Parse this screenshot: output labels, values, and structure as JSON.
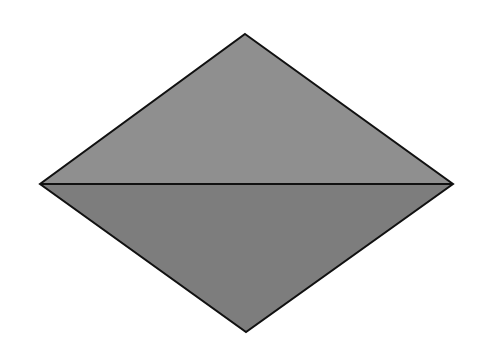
{
  "diagram": {
    "type": "rhombus-split-by-diagonal",
    "background": "#ffffff",
    "stroke_color": "#111111",
    "stroke_width": 2,
    "vertices": {
      "top": [
        245,
        34
      ],
      "left": [
        40,
        184
      ],
      "right": [
        453,
        184
      ],
      "bottom": [
        246,
        332
      ]
    },
    "regions": [
      {
        "name": "upper-triangle",
        "fill": "#8f8f8f",
        "points": [
          "top",
          "right",
          "left"
        ]
      },
      {
        "name": "lower-triangle",
        "fill": "#7d7d7d",
        "points": [
          "left",
          "right",
          "bottom"
        ]
      }
    ],
    "diagonal": {
      "from": "left",
      "to": "right"
    }
  }
}
